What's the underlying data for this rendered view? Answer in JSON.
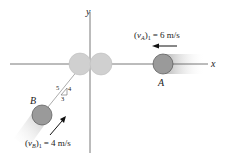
{
  "diagram": {
    "axes": {
      "x_label": "x",
      "y_label": "y"
    },
    "particle_A": {
      "label": "A",
      "velocity_symbol": "v",
      "velocity_subscript": "A",
      "velocity_state": "1",
      "velocity_value": "= 6 m/s",
      "direction": "left",
      "color": "#9a9a9a"
    },
    "particle_B": {
      "label": "B",
      "velocity_symbol": "v",
      "velocity_subscript": "B",
      "velocity_state": "1",
      "velocity_value": "= 4 m/s",
      "direction": "up-right",
      "color": "#9a9a9a"
    },
    "slope_triangle": {
      "hypotenuse": "5",
      "vertical": "4",
      "horizontal": "3"
    },
    "collision_ghost_color": "#d0d0d0"
  }
}
